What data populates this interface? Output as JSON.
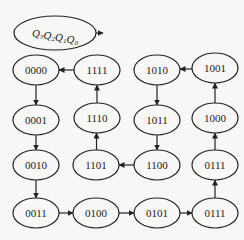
{
  "legend": {
    "label_parts": [
      {
        "base": "Q",
        "sub": "3"
      },
      {
        "base": "Q",
        "sub": "2"
      },
      {
        "base": "Q",
        "sub": "1"
      },
      {
        "base": "Q",
        "sub": "0"
      }
    ],
    "center": [
      55,
      33
    ],
    "rx": 41,
    "ry": 17,
    "arrow_to": [
      103,
      33
    ]
  },
  "colors": {
    "stroke": "#222222",
    "background": "#f7f7f5"
  },
  "nodes": [
    {
      "id": "s0000",
      "label": "0000",
      "cx": 36,
      "cy": 70,
      "rx": 23,
      "ry": 15
    },
    {
      "id": "s1111",
      "label": "1111",
      "cx": 97,
      "cy": 70,
      "rx": 23,
      "ry": 15
    },
    {
      "id": "s1010",
      "label": "1010",
      "cx": 157,
      "cy": 70,
      "rx": 23,
      "ry": 15
    },
    {
      "id": "s1001",
      "label": "1001",
      "cx": 215,
      "cy": 68,
      "rx": 23,
      "ry": 15
    },
    {
      "id": "s0001",
      "label": "0001",
      "cx": 36,
      "cy": 120,
      "rx": 23,
      "ry": 15
    },
    {
      "id": "s1110",
      "label": "1110",
      "cx": 97,
      "cy": 118,
      "rx": 23,
      "ry": 15
    },
    {
      "id": "s1011",
      "label": "1011",
      "cx": 157,
      "cy": 120,
      "rx": 23,
      "ry": 15
    },
    {
      "id": "s1000",
      "label": "1000",
      "cx": 215,
      "cy": 118,
      "rx": 23,
      "ry": 15
    },
    {
      "id": "s0010",
      "label": "0010",
      "cx": 36,
      "cy": 165,
      "rx": 23,
      "ry": 15
    },
    {
      "id": "s1101",
      "label": "1101",
      "cx": 96,
      "cy": 165,
      "rx": 23,
      "ry": 15
    },
    {
      "id": "s1100",
      "label": "1100",
      "cx": 157,
      "cy": 165,
      "rx": 23,
      "ry": 15
    },
    {
      "id": "s0111a",
      "label": "0111",
      "cx": 215,
      "cy": 165,
      "rx": 23,
      "ry": 15
    },
    {
      "id": "s0011",
      "label": "0011",
      "cx": 36,
      "cy": 213,
      "rx": 23,
      "ry": 15
    },
    {
      "id": "s0100",
      "label": "0100",
      "cx": 96,
      "cy": 213,
      "rx": 23,
      "ry": 15
    },
    {
      "id": "s0101",
      "label": "0101",
      "cx": 157,
      "cy": 213,
      "rx": 23,
      "ry": 15
    },
    {
      "id": "s0111b",
      "label": "0111",
      "cx": 215,
      "cy": 213,
      "rx": 23,
      "ry": 15
    }
  ],
  "edges": [
    {
      "from": "s0000",
      "to": "s0001"
    },
    {
      "from": "s0001",
      "to": "s0010"
    },
    {
      "from": "s0010",
      "to": "s0011"
    },
    {
      "from": "s0011",
      "to": "s0100"
    },
    {
      "from": "s0100",
      "to": "s0101"
    },
    {
      "from": "s0101",
      "to": "s0111b"
    },
    {
      "from": "s0111b",
      "to": "s0111a"
    },
    {
      "from": "s0111a",
      "to": "s1000"
    },
    {
      "from": "s1000",
      "to": "s1001"
    },
    {
      "from": "s1001",
      "to": "s1010"
    },
    {
      "from": "s1010",
      "to": "s1011"
    },
    {
      "from": "s1011",
      "to": "s1100"
    },
    {
      "from": "s1100",
      "to": "s1101"
    },
    {
      "from": "s1101",
      "to": "s1110"
    },
    {
      "from": "s1110",
      "to": "s1111"
    },
    {
      "from": "s1111",
      "to": "s0000"
    }
  ]
}
